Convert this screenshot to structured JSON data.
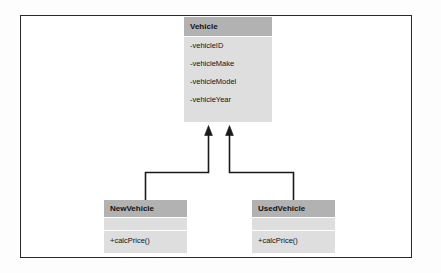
{
  "diagram": {
    "type": "uml-class-diagram",
    "frame": {
      "border_color": "#2a2a2a",
      "background": "#ffffff"
    },
    "colors": {
      "header_fill": "#b2b2b2",
      "body_fill": "#dedede",
      "connector": "#1a1a1a",
      "text": "#111111"
    },
    "classes": [
      {
        "id": "vehicle",
        "name": "Vehicle",
        "role": "superclass",
        "attributes": [
          "-vehicleID",
          "-vehicleMake",
          "-vehicleModel",
          "-vehicleYear"
        ],
        "operations": []
      },
      {
        "id": "newvehicle",
        "name": "NewVehicle",
        "role": "subclass",
        "attributes": [],
        "operations": [
          "+calcPrice()"
        ]
      },
      {
        "id": "usedvehicle",
        "name": "UsedVehicle",
        "role": "subclass",
        "attributes": [],
        "operations": [
          "+calcPrice()"
        ]
      }
    ],
    "relationships": [
      {
        "id": "newvehicle-to-vehicle",
        "type": "generalization",
        "from": "NewVehicle",
        "to": "Vehicle",
        "arrowhead": "filled-triangle",
        "routing": "orthogonal"
      },
      {
        "id": "usedvehicle-to-vehicle",
        "type": "generalization",
        "from": "UsedVehicle",
        "to": "Vehicle",
        "arrowhead": "filled-triangle",
        "routing": "orthogonal"
      }
    ]
  }
}
